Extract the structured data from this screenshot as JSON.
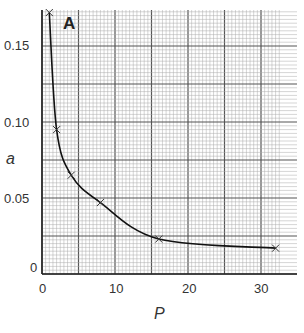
{
  "chart_data": {
    "type": "line",
    "title": "",
    "panel_label": "A",
    "xlabel": "P",
    "ylabel": "a",
    "xlim": [
      0,
      32.5
    ],
    "ylim": [
      0,
      0.175
    ],
    "x_ticks": [
      "0",
      "10",
      "20",
      "30"
    ],
    "y_ticks": [
      "0",
      "0.05",
      "0.10",
      "0.15"
    ],
    "grid": true,
    "series": [
      {
        "name": "a vs P",
        "marker": "x",
        "x": [
          1,
          2,
          4,
          8,
          16,
          32
        ],
        "values": [
          0.172,
          0.095,
          0.065,
          0.047,
          0.023,
          0.017
        ]
      }
    ]
  }
}
